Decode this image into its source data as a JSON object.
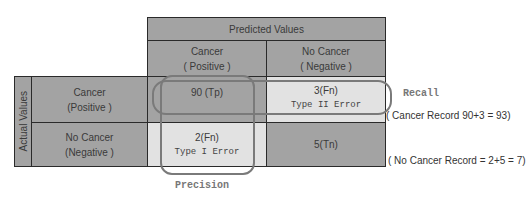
{
  "header": {
    "predicted_values": "Predicted Values",
    "actual_values": "Actual Values"
  },
  "columns": [
    {
      "line1": "Cancer",
      "line2": "( Positive )"
    },
    {
      "line1": "No Cancer",
      "line2": "( Negative )"
    }
  ],
  "rows": [
    {
      "line1": "Cancer",
      "line2": "(Positive )"
    },
    {
      "line1": "No Cancer",
      "line2": "(Negative  )"
    }
  ],
  "cells": {
    "tp": {
      "value": "90 (Tp)",
      "note": ""
    },
    "fn": {
      "value": "3(Fn)",
      "note": "Type II Error"
    },
    "fp": {
      "value": "2(Fn)",
      "note": "Type I Error"
    },
    "tn": {
      "value": "5(Tn)",
      "note": ""
    }
  },
  "annotations": {
    "recall": "Recall",
    "precision": "Precision",
    "cancer_record": "( Cancer Record 90+3 = 93)",
    "no_cancer_record": "( No Cancer Record = 2+5 = 7)"
  },
  "colors": {
    "dark_cell": "#a3a3a3",
    "light_cell": "#e2e2e2",
    "oval_border": "#7a7a7a"
  }
}
